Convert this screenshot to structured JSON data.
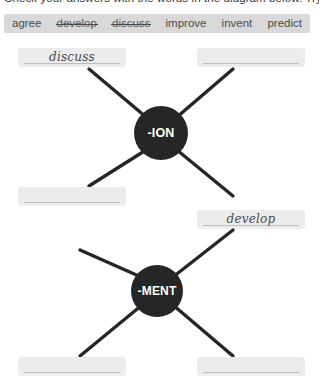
{
  "instruction": {
    "text": "Check your answers with the words in the diagram below. Try..."
  },
  "word_bank": {
    "name": "word-bank",
    "words": [
      {
        "text": "agree",
        "struck": false
      },
      {
        "text": "develop",
        "struck": true
      },
      {
        "text": "discuss",
        "struck": true
      },
      {
        "text": "improve",
        "struck": false
      },
      {
        "text": "invent",
        "struck": false
      },
      {
        "text": "predict",
        "struck": false
      }
    ]
  },
  "diagrams": [
    {
      "id": "ion",
      "hub_label": "-ION",
      "slots": [
        {
          "id": "ion-tl",
          "answer": "discuss",
          "filled": true
        },
        {
          "id": "ion-tr",
          "answer": "",
          "filled": false
        },
        {
          "id": "ion-bl",
          "answer": "",
          "filled": false
        }
      ]
    },
    {
      "id": "ment",
      "hub_label": "-MENT",
      "slots": [
        {
          "id": "ment-tr",
          "answer": "develop",
          "filled": true
        },
        {
          "id": "ment-bl",
          "answer": "",
          "filled": false
        },
        {
          "id": "ment-br",
          "answer": "",
          "filled": false
        }
      ]
    }
  ],
  "colors": {
    "page_background": "#ffffff",
    "word_bank_background": "#d9d9d9",
    "slot_background": "#ececec",
    "hub_background": "#262626",
    "hub_text": "#ffffff",
    "connector": "#262626",
    "handwriting": "#4a4a4a"
  }
}
